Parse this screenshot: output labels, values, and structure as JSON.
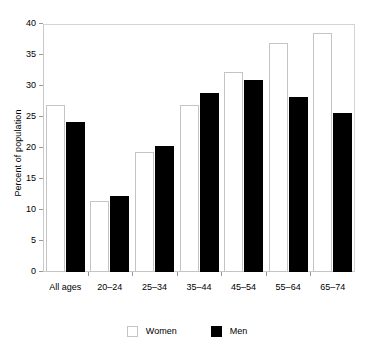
{
  "chart_data": {
    "type": "bar",
    "title": "",
    "subtitle": "",
    "xlabel": "",
    "ylabel": "Percent of population",
    "ylim": [
      0,
      40
    ],
    "ytick_step": 5,
    "yticks": [
      0,
      5,
      10,
      15,
      20,
      25,
      30,
      35,
      40
    ],
    "grid": false,
    "legend_position": "bottom",
    "categories": [
      "All ages",
      "20–24",
      "25–34",
      "35–44",
      "45–54",
      "55–64",
      "65–74"
    ],
    "series": [
      {
        "name": "Women",
        "color": "#ffffff",
        "edge_color": "#c4c4c4",
        "values": [
          27.0,
          11.4,
          19.4,
          27.0,
          32.3,
          36.9,
          38.5
        ]
      },
      {
        "name": "Men",
        "color": "#000000",
        "edge_color": "#000000",
        "values": [
          24.2,
          12.2,
          20.3,
          28.9,
          31.0,
          28.2,
          25.6
        ]
      }
    ],
    "annotations": []
  },
  "axis": {
    "y_title": "Percent of population",
    "y_tick_labels": [
      "0",
      "5",
      "10",
      "15",
      "20",
      "25",
      "30",
      "35",
      "40"
    ]
  },
  "legend": {
    "items": [
      {
        "label": "Women",
        "swatch": "legend-swatch-women"
      },
      {
        "label": "Men",
        "swatch": "legend-swatch-men"
      }
    ]
  },
  "colors": {
    "women_fill": "#ffffff",
    "women_edge": "#c4c4c4",
    "men_fill": "#000000",
    "frame": "#c9c9c9",
    "text": "#000000",
    "background": "#ffffff"
  }
}
